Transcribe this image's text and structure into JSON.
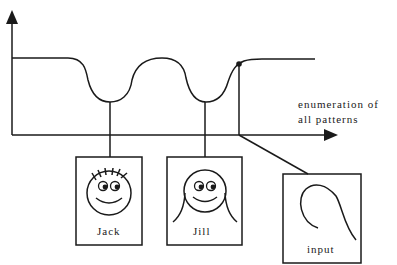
{
  "diagram": {
    "axis_label": {
      "line1": "enumeration  of",
      "line2": "all   patterns"
    },
    "nodes": [
      {
        "id": "jack",
        "label": "Jack",
        "icon": "smiley-spiky-hair"
      },
      {
        "id": "jill",
        "label": "Jill",
        "icon": "smiley-long-hair"
      },
      {
        "id": "input",
        "label": "input",
        "icon": "hook-curve"
      }
    ],
    "colors": {
      "stroke": "#1a1a1a",
      "background": "#ffffff"
    }
  }
}
